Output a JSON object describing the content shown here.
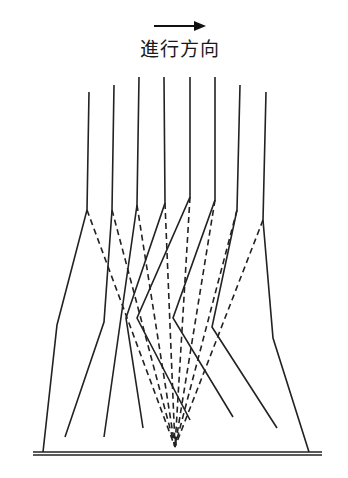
{
  "title": {
    "direction_label": "進行方向",
    "arrow_icon": "right-arrow"
  },
  "diagram": {
    "type": "ray-path diagram",
    "focal_point": [
      175,
      447
    ],
    "ground": {
      "x_start": 33,
      "x_end": 322,
      "y_upper": 452,
      "y_lower": 455
    },
    "paths": [
      {
        "id": 1,
        "solid": [
          [
            89,
            92
          ],
          [
            87,
            210
          ],
          [
            57,
            325
          ],
          [
            43,
            452
          ]
        ],
        "kink": [
          87,
          210
        ]
      },
      {
        "id": 2,
        "solid": [
          [
            114,
            85
          ],
          [
            112,
            210
          ],
          [
            104,
            322
          ],
          [
            65,
            437
          ]
        ],
        "kink": [
          112,
          210
        ]
      },
      {
        "id": 3,
        "solid": [
          [
            139,
            77
          ],
          [
            137,
            205
          ],
          [
            104,
            437
          ]
        ],
        "kink": [
          137,
          205
        ]
      },
      {
        "id": 4,
        "solid": [
          [
            164,
            77
          ],
          [
            165,
            203
          ],
          [
            126,
            318
          ],
          [
            143,
            428
          ]
        ],
        "kink": [
          165,
          203
        ]
      },
      {
        "id": 5,
        "solid": [
          [
            190,
            77
          ],
          [
            190,
            197
          ],
          [
            137,
            318
          ],
          [
            190,
            420
          ]
        ],
        "kink": [
          190,
          197
        ]
      },
      {
        "id": 6,
        "solid": [
          [
            215,
            77
          ],
          [
            215,
            200
          ],
          [
            173,
            318
          ],
          [
            233,
            417
          ]
        ],
        "kink": [
          215,
          200
        ]
      },
      {
        "id": 7,
        "solid": [
          [
            240,
            85
          ],
          [
            237,
            210
          ],
          [
            212,
            327
          ],
          [
            277,
            428
          ]
        ],
        "kink": [
          237,
          210
        ]
      },
      {
        "id": 8,
        "solid": [
          [
            266,
            92
          ],
          [
            263,
            220
          ],
          [
            273,
            338
          ],
          [
            309,
            452
          ]
        ],
        "kink": [
          263,
          220
        ]
      }
    ]
  }
}
